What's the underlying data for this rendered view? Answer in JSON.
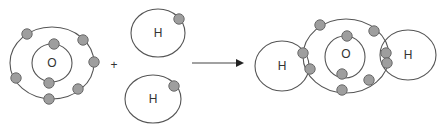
{
  "diagram": {
    "colors": {
      "orbit_stroke": "#555555",
      "electron_fill": "#9e9e9e",
      "electron_stroke": "#6a6a6a",
      "text": "#333333",
      "background": "#ffffff"
    },
    "reactants": {
      "oxygen": {
        "label": "O",
        "center": [
          52,
          63
        ],
        "inner_shell": {
          "rx": 20,
          "ry": 19
        },
        "outer_shell": {
          "rx": 42,
          "ry": 36
        },
        "electrons": [
          [
            54,
            44
          ],
          [
            49,
            83
          ],
          [
            27,
            34
          ],
          [
            83,
            40
          ],
          [
            94,
            62
          ],
          [
            16,
            78
          ],
          [
            78,
            89
          ],
          [
            49,
            99
          ]
        ]
      },
      "plus_sign": "+",
      "plus_pos": [
        114,
        65
      ],
      "hydrogen_1": {
        "label": "H",
        "center": [
          158,
          33
        ],
        "shell": {
          "rx": 27,
          "ry": 24
        },
        "electrons": [
          [
            179,
            19
          ]
        ]
      },
      "hydrogen_2": {
        "label": "H",
        "center": [
          153,
          99
        ],
        "shell": {
          "rx": 28,
          "ry": 24
        },
        "electrons": [
          [
            174,
            86
          ]
        ]
      }
    },
    "arrow": {
      "x1": 192,
      "y1": 63,
      "x2": 244,
      "y2": 63
    },
    "product": {
      "name": "water molecule",
      "oxygen": {
        "label": "O",
        "center": [
          346,
          56
        ],
        "inner_shell": {
          "rx": 20,
          "ry": 21
        },
        "outer_shell": {
          "rx": 43,
          "ry": 37
        },
        "electrons": [
          [
            347,
            36
          ],
          [
            342,
            74
          ],
          [
            320,
            25
          ],
          [
            374,
            31
          ],
          [
            303,
            53
          ],
          [
            386,
            53
          ],
          [
            310,
            69
          ],
          [
            387,
            63
          ],
          [
            369,
            80
          ],
          [
            342,
            90
          ]
        ]
      },
      "hydrogen_left": {
        "label": "H",
        "center": [
          282,
          66
        ],
        "shell": {
          "rx": 27,
          "ry": 25
        }
      },
      "hydrogen_right": {
        "label": "H",
        "center": [
          408,
          55
        ],
        "shell": {
          "rx": 28,
          "ry": 25
        }
      }
    }
  }
}
